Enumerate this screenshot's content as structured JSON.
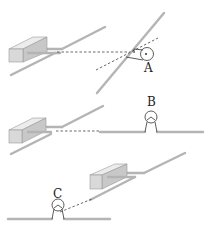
{
  "figure": {
    "labels": {
      "a": "A",
      "b": "B",
      "c": "C"
    },
    "panels": [
      {
        "name": "top",
        "description": "Box with rods aimed at rotating observer A, dashed sight lines"
      },
      {
        "name": "middle",
        "description": "Box with rods, dashed line to ground line with observer B"
      },
      {
        "name": "bottom",
        "description": "Box with rods, dashed line from observer C on ground line"
      }
    ],
    "colors": {
      "rod": "#b4b4b4",
      "box": "#d9d9d9",
      "ink": "#333333"
    }
  }
}
